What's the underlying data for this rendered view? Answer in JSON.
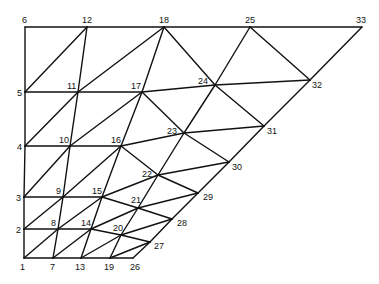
{
  "diagram": {
    "type": "finite-element-mesh",
    "nodes": [
      {
        "id": "1",
        "x": 24,
        "y": 258,
        "lx": 20,
        "ly": 270
      },
      {
        "id": "2",
        "x": 24,
        "y": 229,
        "lx": 16,
        "ly": 233
      },
      {
        "id": "3",
        "x": 24,
        "y": 197,
        "lx": 16,
        "ly": 201
      },
      {
        "id": "4",
        "x": 25,
        "y": 146,
        "lx": 17,
        "ly": 150
      },
      {
        "id": "5",
        "x": 25,
        "y": 92,
        "lx": 17,
        "ly": 96
      },
      {
        "id": "6",
        "x": 25,
        "y": 27,
        "lx": 22,
        "ly": 23
      },
      {
        "id": "7",
        "x": 53,
        "y": 258,
        "lx": 50,
        "ly": 270
      },
      {
        "id": "8",
        "x": 58,
        "y": 229,
        "lx": 51,
        "ly": 226
      },
      {
        "id": "9",
        "x": 63,
        "y": 197,
        "lx": 56,
        "ly": 194
      },
      {
        "id": "10",
        "x": 70,
        "y": 146,
        "lx": 59,
        "ly": 143
      },
      {
        "id": "11",
        "x": 78,
        "y": 92,
        "lx": 67,
        "ly": 89
      },
      {
        "id": "12",
        "x": 87,
        "y": 27,
        "lx": 82,
        "ly": 23
      },
      {
        "id": "13",
        "x": 81,
        "y": 258,
        "lx": 75,
        "ly": 270
      },
      {
        "id": "14",
        "x": 91,
        "y": 229,
        "lx": 81,
        "ly": 226
      },
      {
        "id": "15",
        "x": 102,
        "y": 197,
        "lx": 92,
        "ly": 194
      },
      {
        "id": "16",
        "x": 121,
        "y": 146,
        "lx": 111,
        "ly": 143
      },
      {
        "id": "17",
        "x": 142,
        "y": 92,
        "lx": 131,
        "ly": 89
      },
      {
        "id": "18",
        "x": 164,
        "y": 27,
        "lx": 159,
        "ly": 23
      },
      {
        "id": "19",
        "x": 110,
        "y": 258,
        "lx": 104,
        "ly": 270
      },
      {
        "id": "20",
        "x": 121,
        "y": 235,
        "lx": 113,
        "ly": 231
      },
      {
        "id": "21",
        "x": 138,
        "y": 208,
        "lx": 131,
        "ly": 203
      },
      {
        "id": "22",
        "x": 158,
        "y": 175,
        "lx": 142,
        "ly": 177
      },
      {
        "id": "23",
        "x": 184,
        "y": 133,
        "lx": 167,
        "ly": 134
      },
      {
        "id": "24",
        "x": 215,
        "y": 85,
        "lx": 198,
        "ly": 84
      },
      {
        "id": "25",
        "x": 250,
        "y": 27,
        "lx": 245,
        "ly": 23
      },
      {
        "id": "26",
        "x": 133,
        "y": 258,
        "lx": 130,
        "ly": 270
      },
      {
        "id": "27",
        "x": 150,
        "y": 242,
        "lx": 154,
        "ly": 249
      },
      {
        "id": "28",
        "x": 172,
        "y": 219,
        "lx": 177,
        "ly": 226
      },
      {
        "id": "29",
        "x": 198,
        "y": 193,
        "lx": 203,
        "ly": 200
      },
      {
        "id": "30",
        "x": 229,
        "y": 162,
        "lx": 232,
        "ly": 170
      },
      {
        "id": "31",
        "x": 264,
        "y": 126,
        "lx": 267,
        "ly": 134
      },
      {
        "id": "32",
        "x": 310,
        "y": 80,
        "lx": 312,
        "ly": 88
      },
      {
        "id": "33",
        "x": 362,
        "y": 27,
        "lx": 356,
        "ly": 23
      }
    ],
    "edges": [
      [
        "1",
        "2"
      ],
      [
        "2",
        "3"
      ],
      [
        "3",
        "4"
      ],
      [
        "4",
        "5"
      ],
      [
        "5",
        "6"
      ],
      [
        "6",
        "12"
      ],
      [
        "12",
        "18"
      ],
      [
        "18",
        "25"
      ],
      [
        "25",
        "33"
      ],
      [
        "33",
        "32"
      ],
      [
        "32",
        "31"
      ],
      [
        "31",
        "30"
      ],
      [
        "30",
        "29"
      ],
      [
        "29",
        "28"
      ],
      [
        "28",
        "27"
      ],
      [
        "27",
        "26"
      ],
      [
        "1",
        "7"
      ],
      [
        "7",
        "13"
      ],
      [
        "13",
        "19"
      ],
      [
        "19",
        "26"
      ],
      [
        "2",
        "8"
      ],
      [
        "8",
        "14"
      ],
      [
        "3",
        "9"
      ],
      [
        "9",
        "15"
      ],
      [
        "4",
        "10"
      ],
      [
        "10",
        "16"
      ],
      [
        "16",
        "23"
      ],
      [
        "23",
        "31"
      ],
      [
        "5",
        "11"
      ],
      [
        "11",
        "17"
      ],
      [
        "17",
        "24"
      ],
      [
        "24",
        "32"
      ],
      [
        "7",
        "8"
      ],
      [
        "8",
        "9"
      ],
      [
        "9",
        "10"
      ],
      [
        "10",
        "11"
      ],
      [
        "11",
        "12"
      ],
      [
        "13",
        "14"
      ],
      [
        "14",
        "15"
      ],
      [
        "15",
        "16"
      ],
      [
        "16",
        "17"
      ],
      [
        "17",
        "18"
      ],
      [
        "19",
        "20"
      ],
      [
        "20",
        "21"
      ],
      [
        "21",
        "22"
      ],
      [
        "22",
        "23"
      ],
      [
        "23",
        "24"
      ],
      [
        "24",
        "25"
      ],
      [
        "1",
        "8"
      ],
      [
        "2",
        "9"
      ],
      [
        "3",
        "10"
      ],
      [
        "4",
        "11"
      ],
      [
        "5",
        "12"
      ],
      [
        "7",
        "14"
      ],
      [
        "8",
        "15"
      ],
      [
        "9",
        "16"
      ],
      [
        "10",
        "17"
      ],
      [
        "11",
        "18"
      ],
      [
        "13",
        "20"
      ],
      [
        "14",
        "21"
      ],
      [
        "15",
        "22"
      ],
      [
        "16",
        "22"
      ],
      [
        "14",
        "20"
      ],
      [
        "20",
        "27"
      ],
      [
        "20",
        "28"
      ],
      [
        "15",
        "21"
      ],
      [
        "21",
        "28"
      ],
      [
        "21",
        "29"
      ],
      [
        "22",
        "29"
      ],
      [
        "22",
        "30"
      ],
      [
        "17",
        "23"
      ],
      [
        "23",
        "30"
      ],
      [
        "18",
        "24"
      ],
      [
        "24",
        "31"
      ],
      [
        "25",
        "32"
      ],
      [
        "19",
        "27"
      ]
    ]
  }
}
